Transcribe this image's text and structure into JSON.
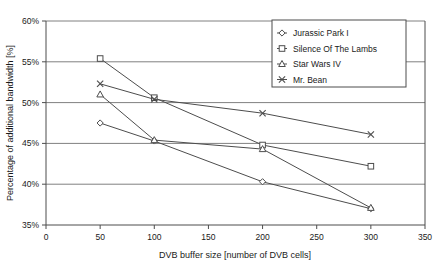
{
  "chart_data": {
    "type": "line",
    "title": "",
    "xlabel": "DVB buffer size [number of DVB cells]",
    "ylabel": "Percentage of additional bandwidth [%]",
    "x": [
      50,
      100,
      200,
      300
    ],
    "xlim": [
      0,
      350
    ],
    "ylim": [
      35,
      60
    ],
    "xticks": [
      "0",
      "50",
      "100",
      "150",
      "200",
      "250",
      "300",
      "350"
    ],
    "xtick_values": [
      0,
      50,
      100,
      150,
      200,
      250,
      300,
      350
    ],
    "yticks": [
      "35%",
      "40%",
      "45%",
      "50%",
      "55%",
      "60%"
    ],
    "ytick_values": [
      35,
      40,
      45,
      50,
      55,
      60
    ],
    "grid": "horizontal",
    "legend_position": "top-right",
    "series": [
      {
        "name": "Jurassic Park I",
        "marker": "diamond",
        "values": [
          47.5,
          45.3,
          40.3,
          37.0
        ]
      },
      {
        "name": "Silence Of The Lambs",
        "marker": "square",
        "values": [
          55.4,
          50.6,
          44.8,
          42.2
        ]
      },
      {
        "name": "Star Wars IV",
        "marker": "triangle",
        "values": [
          51.0,
          45.4,
          44.3,
          37.1
        ]
      },
      {
        "name": "Mr. Bean",
        "marker": "cross",
        "values": [
          52.3,
          50.4,
          48.7,
          46.1
        ]
      }
    ],
    "colors": {
      "line": "#4d4d4d",
      "grid": "#808080",
      "axis": "#4d4d4d",
      "text": "#1a1a1a",
      "background": "#ffffff"
    }
  }
}
